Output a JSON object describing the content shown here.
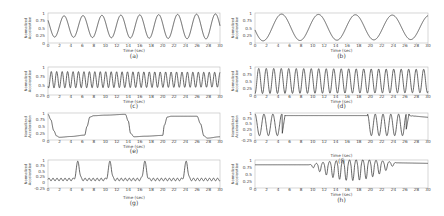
{
  "figure": {
    "background": "#ffffff",
    "line_color": "#333333",
    "axis_color": "#bbbbbb"
  },
  "chart_data": [
    {
      "id": "a",
      "caption": "(a)",
      "type": "line",
      "xlabel": "Time (sec)",
      "ylabel": "Normalized Acceleration",
      "xlim": [
        0,
        30
      ],
      "ylim": [
        0,
        1
      ],
      "xticks": [
        "0",
        "2",
        "4",
        "6",
        "8",
        "10",
        "12",
        "14",
        "16",
        "18",
        "20",
        "22",
        "24",
        "26",
        "28",
        "30"
      ],
      "yticks": [
        "0",
        "0.25",
        "0.5",
        "0.75",
        "1"
      ],
      "signal": {
        "kind": "sine",
        "period": 3.3,
        "phase": 0.35,
        "offset": 0.55,
        "amp_start": 0.35,
        "amp_end": 0.42
      },
      "box": {
        "x": 48,
        "y": 13,
        "w": 172,
        "h": 30
      },
      "tick_y": 47,
      "xlabel_y": 52,
      "caption_y": 58
    },
    {
      "id": "b",
      "caption": "(b)",
      "type": "line",
      "xlabel": "Time (sec)",
      "ylabel": "Normalized Acceleration",
      "xlim": [
        0,
        30
      ],
      "ylim": [
        0,
        1
      ],
      "xticks": [
        "0",
        "2",
        "4",
        "6",
        "8",
        "10",
        "12",
        "14",
        "16",
        "18",
        "20",
        "22",
        "24",
        "26",
        "28",
        "30"
      ],
      "yticks": [
        "0",
        "0.25",
        "0.5",
        "0.75",
        "1"
      ],
      "signal": {
        "kind": "sine",
        "period": 6.4,
        "phase": 0.22,
        "offset": 0.52,
        "amp_start": 0.45,
        "amp_end": 0.4
      },
      "box": {
        "x": 255,
        "y": 13,
        "w": 173,
        "h": 30
      },
      "tick_y": 47,
      "xlabel_y": 52,
      "caption_y": 58
    },
    {
      "id": "c",
      "caption": "(c)",
      "type": "line",
      "xlabel": "Time (sec)",
      "ylabel": "Normalized Acceleration",
      "xlim": [
        0,
        30
      ],
      "ylim": [
        0.25,
        1
      ],
      "xticks": [
        "0",
        "2",
        "4",
        "6",
        "8",
        "10",
        "12",
        "14",
        "16",
        "18",
        "20",
        "22",
        "24",
        "26",
        "28",
        "30"
      ],
      "yticks": [
        "0.25",
        "0.5",
        "0.75",
        "1"
      ],
      "signal": {
        "kind": "sine",
        "period": 0.95,
        "phase": 0.1,
        "offset": 0.66,
        "amp_start": 0.22,
        "amp_end": 0.2
      },
      "box": {
        "x": 48,
        "y": 67,
        "w": 172,
        "h": 28
      },
      "tick_y": 98,
      "xlabel_y": 103,
      "caption_y": 108
    },
    {
      "id": "d",
      "caption": "(d)",
      "type": "line",
      "xlabel": "Time (sec)",
      "ylabel": "Normalized Acceleration",
      "xlim": [
        0,
        30
      ],
      "ylim": [
        0,
        1
      ],
      "xticks": [
        "0",
        "2",
        "4",
        "6",
        "8",
        "10",
        "12",
        "14",
        "16",
        "18",
        "20",
        "22",
        "24",
        "26",
        "28",
        "30"
      ],
      "yticks": [
        "0",
        "0.25",
        "0.5",
        "0.75",
        "1"
      ],
      "signal": {
        "kind": "sine",
        "period": 1.3,
        "phase": 0.0,
        "offset": 0.5,
        "amp_start": 0.45,
        "amp_end": 0.42
      },
      "box": {
        "x": 255,
        "y": 67,
        "w": 173,
        "h": 28
      },
      "tick_y": 98,
      "xlabel_y": 103,
      "caption_y": 108
    },
    {
      "id": "e",
      "caption": "(e)",
      "type": "line",
      "xlabel": "Time (sec)",
      "ylabel": "Normalized Acceleration",
      "xlim": [
        0,
        30
      ],
      "ylim": [
        0,
        1
      ],
      "xticks": [
        "0",
        "2",
        "4",
        "6",
        "8",
        "10",
        "12",
        "14",
        "16",
        "18",
        "20",
        "22",
        "24",
        "26",
        "28",
        "30"
      ],
      "yticks": [
        "0",
        "0.25",
        "0.5",
        "0.75",
        "1"
      ],
      "signal": {
        "kind": "points",
        "points": [
          [
            0,
            0.95
          ],
          [
            0.5,
            0.75
          ],
          [
            1,
            0.35
          ],
          [
            1.5,
            0.15
          ],
          [
            2,
            0.1
          ],
          [
            4,
            0.13
          ],
          [
            6.4,
            0.18
          ],
          [
            6.8,
            0.5
          ],
          [
            7.3,
            0.85
          ],
          [
            8,
            0.9
          ],
          [
            10,
            0.92
          ],
          [
            13.5,
            0.95
          ],
          [
            14,
            0.7
          ],
          [
            14.4,
            0.25
          ],
          [
            15,
            0.12
          ],
          [
            17,
            0.14
          ],
          [
            20,
            0.17
          ],
          [
            20.3,
            0.55
          ],
          [
            20.8,
            0.85
          ],
          [
            21.5,
            0.88
          ],
          [
            26,
            0.88
          ],
          [
            26.6,
            0.6
          ],
          [
            27.2,
            0.15
          ],
          [
            27.8,
            0.07
          ],
          [
            30,
            0.12
          ]
        ]
      },
      "box": {
        "x": 48,
        "y": 113,
        "w": 172,
        "h": 27
      },
      "tick_y": 143,
      "xlabel_y": 148,
      "caption_y": 153
    },
    {
      "id": "f",
      "caption": "(f)",
      "type": "line",
      "xlabel": "Time (sec)",
      "ylabel": "Normalized Acceleration",
      "xlim": [
        0,
        30
      ],
      "ylim": [
        -0.25,
        1
      ],
      "xticks": [
        "0",
        "2",
        "4",
        "6",
        "8",
        "10",
        "12",
        "14",
        "16",
        "18",
        "20",
        "22",
        "24",
        "26",
        "28",
        "30"
      ],
      "yticks": [
        "-0.25",
        "0",
        "0.25",
        "0.5",
        "0.75",
        "1"
      ],
      "signal": {
        "kind": "piecewise",
        "segments": [
          {
            "from": 0,
            "to": 4.7,
            "kind": "osc",
            "period": 1.55,
            "offset": 0.45,
            "amp": 0.5
          },
          {
            "from": 4.7,
            "to": 5.2,
            "kind": "ramp",
            "v0": 0.0,
            "v1": 0.9
          },
          {
            "from": 5.2,
            "to": 19.5,
            "kind": "flat",
            "v": 0.88
          },
          {
            "from": 19.5,
            "to": 26.2,
            "kind": "osc",
            "period": 1.35,
            "offset": 0.45,
            "amp": 0.5
          },
          {
            "from": 26.2,
            "to": 26.7,
            "kind": "ramp",
            "v0": 0.2,
            "v1": 0.95
          },
          {
            "from": 26.7,
            "to": 30,
            "kind": "decay",
            "v0": 0.88,
            "v1": 0.8
          }
        ]
      },
      "box": {
        "x": 255,
        "y": 113,
        "w": 173,
        "h": 27
      },
      "tick_y": 143,
      "xlabel_y": 157,
      "caption_y": 163
    },
    {
      "id": "g",
      "caption": "(g)",
      "type": "line",
      "xlabel": "Time (sec)",
      "ylabel": "Normalized Acceleration",
      "xlim": [
        0,
        30
      ],
      "ylim": [
        -0.25,
        1
      ],
      "xticks": [
        "0",
        "2",
        "4",
        "6",
        "8",
        "10",
        "12",
        "14",
        "16",
        "18",
        "20",
        "22",
        "24",
        "26",
        "28",
        "30"
      ],
      "yticks": [
        "-0.25",
        "0",
        "0.25",
        "0.5",
        "0.75",
        "1"
      ],
      "signal": {
        "kind": "peaks",
        "base": 0.13,
        "ripple_amp": 0.06,
        "ripple_period": 0.7,
        "peak_height": 0.95,
        "peak_width": 0.45,
        "peaks": [
          5.2,
          10.8,
          16.9,
          24.1
        ]
      },
      "box": {
        "x": 48,
        "y": 160,
        "w": 172,
        "h": 28
      },
      "tick_y": 191,
      "xlabel_y": 199,
      "caption_y": 205
    },
    {
      "id": "h",
      "caption": "(h)",
      "type": "line",
      "xlabel": "Time (sec)",
      "ylabel": "Normalized Acceleration",
      "xlim": [
        0,
        30
      ],
      "ylim": [
        0,
        1
      ],
      "xticks": [
        "0",
        "2",
        "4",
        "6",
        "8",
        "10",
        "12",
        "14",
        "16",
        "18",
        "20",
        "22",
        "24",
        "26",
        "28",
        "30"
      ],
      "yticks": [
        "0",
        "0.25",
        "0.5",
        "0.75",
        "1"
      ],
      "signal": {
        "kind": "burst",
        "baseline": 0.83,
        "end_baseline": 0.9,
        "center": 17.0,
        "start": 9.2,
        "end": 24.5,
        "period": 1.15,
        "max_amp": 0.48
      },
      "box": {
        "x": 255,
        "y": 160,
        "w": 173,
        "h": 28
      },
      "tick_y": 191,
      "xlabel_y": 196,
      "caption_y": 202
    }
  ]
}
